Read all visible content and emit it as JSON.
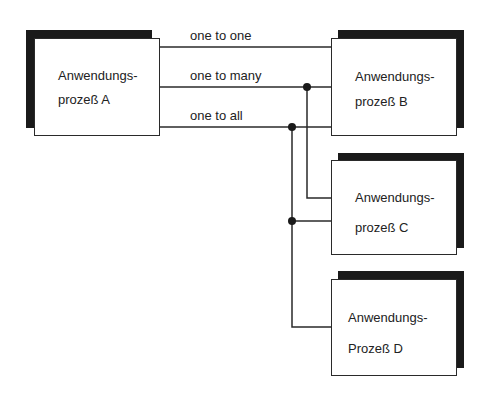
{
  "diagram": {
    "type": "communication-pattern",
    "colors": {
      "line": "#2a2a2a",
      "shadow": "#1a1a1a",
      "box_fill": "#ffffff",
      "text": "#222222"
    },
    "connection_labels": [
      {
        "id": "one-to-one",
        "text": "one to one"
      },
      {
        "id": "one-to-many",
        "text": "one to many"
      },
      {
        "id": "one-to-all",
        "text": "one to all"
      }
    ],
    "processes": [
      {
        "id": "A",
        "line1": "Anwendungs-",
        "line2": "prozeß A"
      },
      {
        "id": "B",
        "line1": "Anwendungs-",
        "line2": "prozeß B"
      },
      {
        "id": "C",
        "line1": "Anwendungs-",
        "line2": "prozeß C"
      },
      {
        "id": "D",
        "line1": "Anwendungs-",
        "line2": "Prozeß D"
      }
    ],
    "edges": [
      {
        "from": "A",
        "to": [
          "B"
        ],
        "label": "one to one"
      },
      {
        "from": "A",
        "to": [
          "B",
          "C"
        ],
        "label": "one to many"
      },
      {
        "from": "A",
        "to": [
          "B",
          "C",
          "D"
        ],
        "label": "one to all"
      }
    ]
  }
}
